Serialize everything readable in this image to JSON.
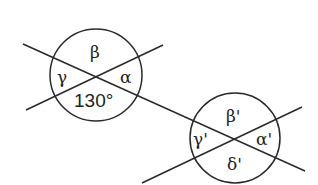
{
  "diagram": {
    "type": "geometry-angles",
    "stroke_color": "#2a2a2a",
    "background": "#ffffff",
    "intersection_1": {
      "center": [
        96,
        75
      ],
      "radius": 46,
      "labels": {
        "top": "β",
        "left": "γ",
        "right": "α",
        "bottom": "130°"
      }
    },
    "intersection_2": {
      "center": [
        235,
        138
      ],
      "radius": 45,
      "labels": {
        "top": "β'",
        "left": "γ'",
        "right": "α'",
        "bottom": "δ'"
      }
    },
    "lines": [
      {
        "name": "line-a",
        "from": [
          26,
          110
        ],
        "to": [
          163,
          45
        ]
      },
      {
        "name": "transversal",
        "from": [
          23,
          44
        ],
        "to": [
          305,
          171
        ]
      },
      {
        "name": "line-b",
        "from": [
          142,
          183
        ],
        "to": [
          302,
          107
        ]
      }
    ]
  }
}
